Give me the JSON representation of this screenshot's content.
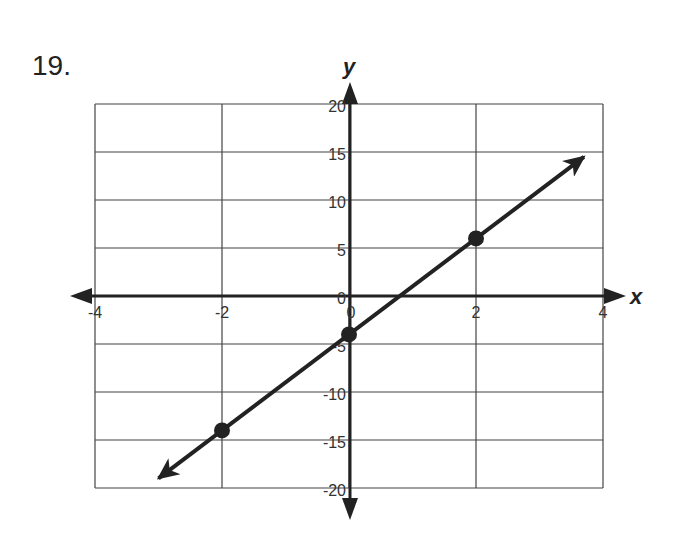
{
  "problem": {
    "number": "19."
  },
  "chart_data": {
    "type": "line",
    "title": "",
    "xlabel": "x",
    "ylabel": "y",
    "xlim": [
      -4,
      4
    ],
    "ylim": [
      -20,
      20
    ],
    "x_ticks": [
      "-4",
      "-2",
      "0",
      "2",
      "4"
    ],
    "y_ticks": [
      "20",
      "15",
      "10",
      "5",
      "0",
      "-5",
      "-10",
      "-15",
      "-20"
    ],
    "grid": true,
    "series": [
      {
        "name": "line",
        "equation": "y = 5x - 4",
        "points": [
          {
            "x": -2,
            "y": -14
          },
          {
            "x": 0,
            "y": -4
          },
          {
            "x": 2,
            "y": 6
          }
        ],
        "arrows_both_ends": true,
        "extent": {
          "x_start": -3,
          "y_start": -19,
          "x_end": 3.7,
          "y_end": 14.5
        }
      }
    ]
  }
}
